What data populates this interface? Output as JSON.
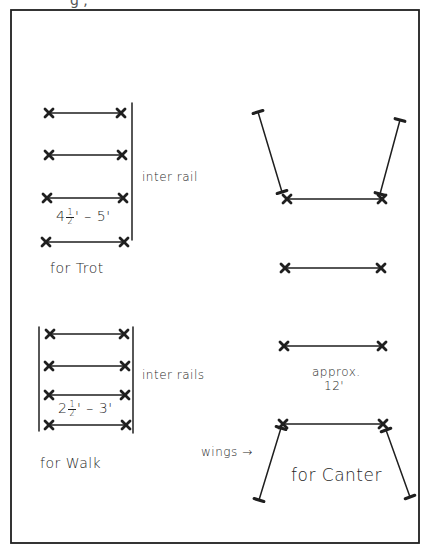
{
  "diagram": {
    "ink_color": "#1f1f1f",
    "background": "#ffffff",
    "frame": {
      "x1": 11,
      "y1": 10,
      "x2": 419,
      "y2": 543
    },
    "top_clipped_text": "g ,"
  },
  "trot": {
    "label": "for Trot",
    "spacing_label_whole": "4",
    "spacing_label_num": "1",
    "spacing_label_den": "2",
    "spacing_label_rest": "' – 5'",
    "side_label": "inter rail",
    "poles": [
      {
        "x1": 49,
        "x2": 121,
        "y": 113
      },
      {
        "x1": 49,
        "x2": 122,
        "y": 155
      },
      {
        "x1": 47,
        "x2": 123,
        "y": 198
      },
      {
        "x1": 46,
        "x2": 124,
        "y": 242
      }
    ],
    "rails": [
      {
        "x": 132,
        "y1": 103,
        "y2": 240
      }
    ]
  },
  "walk": {
    "label": "for Walk",
    "spacing_label_whole": "2",
    "spacing_label_num": "1",
    "spacing_label_den": "2",
    "spacing_label_rest": "' – 3'",
    "side_label": "inter rails",
    "poles": [
      {
        "x1": 50,
        "x2": 124,
        "y": 334
      },
      {
        "x1": 49,
        "x2": 125,
        "y": 366
      },
      {
        "x1": 49,
        "x2": 125,
        "y": 395
      },
      {
        "x1": 49,
        "x2": 126,
        "y": 425
      }
    ],
    "rails": [
      {
        "x": 39,
        "y1": 327,
        "y2": 431
      },
      {
        "x": 133,
        "y1": 327,
        "y2": 433
      }
    ]
  },
  "canter": {
    "label": "for Canter",
    "spacing_label": "approx.",
    "spacing_value": "12'",
    "wings_label": "wings",
    "wings_arrow": "→",
    "poles": [
      {
        "x1": 287,
        "x2": 382,
        "y": 199
      },
      {
        "x1": 285,
        "x2": 381,
        "y": 268
      },
      {
        "x1": 284,
        "x2": 382,
        "y": 346
      },
      {
        "x1": 283,
        "x2": 383,
        "y": 424
      }
    ],
    "wings": [
      {
        "x1": 258,
        "y1": 112,
        "x2": 282,
        "y2": 192
      },
      {
        "x1": 400,
        "y1": 120,
        "x2": 380,
        "y2": 194
      },
      {
        "x1": 281,
        "y1": 428,
        "x2": 259,
        "y2": 500
      },
      {
        "x1": 386,
        "y1": 430,
        "x2": 410,
        "y2": 497
      }
    ]
  }
}
